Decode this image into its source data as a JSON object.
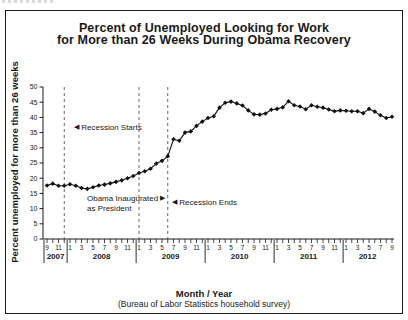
{
  "figure": {
    "title_line1": "Percent of Unemployed Looking for Work",
    "title_line2": "for More than 26 Weeks During Obama Recovery"
  },
  "icons": {
    "left_arrow": "◀",
    "right_arrow": "▶"
  },
  "chart_data": {
    "type": "line",
    "title": "Percent of Unemployed Looking for Work for More than 26 Weeks During Obama Recovery",
    "ylabel": "Percent unemployed for more than 26 weeks",
    "xlabel": "Month / Year",
    "x_sublabel": "(Bureau of Labor Statistics household survey)",
    "ylim": [
      0,
      50
    ],
    "ytick_step": 5,
    "grid": false,
    "legend": "none",
    "marker": "diamond",
    "series_color": "#111111",
    "x_start_month": 9,
    "x_start_year": 2007,
    "month_label_every": 2,
    "years": [
      {
        "label": "2007",
        "months": 4
      },
      {
        "label": "2008",
        "months": 12
      },
      {
        "label": "2009",
        "months": 12
      },
      {
        "label": "2010",
        "months": 12
      },
      {
        "label": "2011",
        "months": 12
      },
      {
        "label": "2012",
        "months": 9
      }
    ],
    "values": [
      17.6,
      18.2,
      17.5,
      17.5,
      18.0,
      17.5,
      16.8,
      16.5,
      17.0,
      17.6,
      17.9,
      18.3,
      18.8,
      19.3,
      20.0,
      20.7,
      21.7,
      22.3,
      23.1,
      24.8,
      25.7,
      27.2,
      32.8,
      32.3,
      35.0,
      35.4,
      37.2,
      38.6,
      39.8,
      40.4,
      43.2,
      44.8,
      45.2,
      44.6,
      43.9,
      42.3,
      41.0,
      40.9,
      41.3,
      42.5,
      42.8,
      43.3,
      45.3,
      44.0,
      43.6,
      42.7,
      44.0,
      43.5,
      43.2,
      42.6,
      42.0,
      42.3,
      42.2,
      42.0,
      42.0,
      41.4,
      42.8,
      41.9,
      40.7,
      39.8,
      40.2
    ],
    "annotations": [
      {
        "label": "Recession Starts",
        "arrow": "left",
        "monthIndex": 3,
        "month": "12/2007"
      },
      {
        "label": "Obama Inaugurated",
        "label2": "as President",
        "arrow": "right",
        "monthIndex": 16,
        "month": "1/2009"
      },
      {
        "label": "Recession Ends",
        "arrow": "left",
        "monthIndex": 21,
        "month": "6/2009"
      }
    ]
  }
}
